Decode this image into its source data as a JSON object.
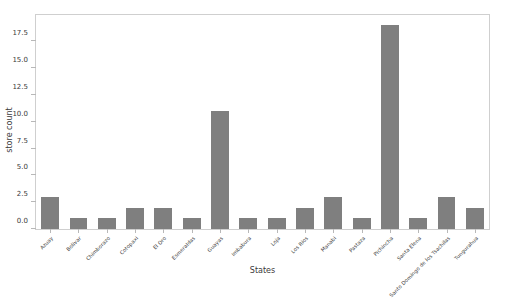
{
  "chart_data": {
    "type": "bar",
    "title": "",
    "xlabel": "States",
    "ylabel": "store count",
    "categories": [
      "Azuay",
      "Bolivar",
      "Chimborazo",
      "Cotopaxi",
      "El Oro",
      "Esmeraldas",
      "Guayas",
      "Imbabura",
      "Loja",
      "Los Rios",
      "Manabi",
      "Pastaza",
      "Pichincha",
      "Santa Elena",
      "Santo Domingo de los Tsachilas",
      "Tungurahua"
    ],
    "values": [
      3,
      1,
      1,
      2,
      2,
      1,
      11,
      1,
      1,
      2,
      3,
      1,
      19,
      1,
      3,
      2
    ],
    "ylim": [
      0,
      19.95
    ],
    "yticks": [
      0.0,
      2.5,
      5.0,
      7.5,
      10.0,
      12.5,
      15.0,
      17.5
    ],
    "ytick_labels": [
      "0.0",
      "2.5",
      "5.0",
      "7.5",
      "10.0",
      "12.5",
      "15.0",
      "17.5"
    ],
    "grid": false,
    "legend": null,
    "bar_color": "#7f7f7f",
    "axes_color": "#cfcfcf",
    "text_color": "#3a3a3a",
    "background": "#ffffff"
  }
}
